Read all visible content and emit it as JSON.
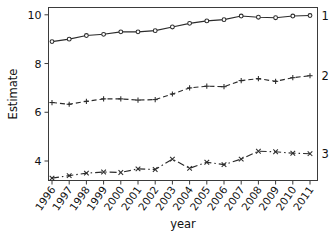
{
  "chart_data": {
    "type": "line",
    "title": "",
    "xlabel": "year",
    "ylabel": "Estimate",
    "grid": false,
    "legend_position": "right-inline-end-of-line",
    "categories": [
      "1996",
      "1997",
      "1998",
      "1999",
      "2000",
      "2001",
      "2002",
      "2003",
      "2004",
      "2005",
      "2006",
      "2007",
      "2008",
      "2009",
      "2010",
      "2011"
    ],
    "x": [
      1996,
      1997,
      1998,
      1999,
      2000,
      2001,
      2002,
      2003,
      2004,
      2005,
      2006,
      2007,
      2008,
      2009,
      2010,
      2011
    ],
    "xlim": [
      1996,
      2011
    ],
    "ylim": [
      3.2,
      10.3
    ],
    "yticks": [
      4,
      6,
      8,
      10
    ],
    "ytick_labels": [
      "4",
      "6",
      "8",
      "10"
    ],
    "series": [
      {
        "name": "1",
        "label": "1",
        "marker": "circle",
        "linestyle": "solid",
        "color": "#2b2b2b",
        "values": [
          8.9,
          9.0,
          9.15,
          9.2,
          9.3,
          9.3,
          9.35,
          9.5,
          9.65,
          9.75,
          9.8,
          9.95,
          9.9,
          9.88,
          9.95,
          9.97
        ]
      },
      {
        "name": "2",
        "label": "2",
        "marker": "plus",
        "linestyle": "dashed",
        "color": "#2b2b2b",
        "values": [
          6.4,
          6.33,
          6.45,
          6.55,
          6.55,
          6.5,
          6.52,
          6.75,
          7.0,
          7.07,
          7.05,
          7.3,
          7.38,
          7.27,
          7.42,
          7.5
        ]
      },
      {
        "name": "3",
        "label": "3",
        "marker": "x",
        "linestyle": "dashdot",
        "color": "#2b2b2b",
        "values": [
          3.3,
          3.4,
          3.5,
          3.55,
          3.53,
          3.68,
          3.65,
          4.08,
          3.7,
          3.95,
          3.85,
          4.08,
          4.4,
          4.38,
          4.32,
          4.3
        ]
      }
    ]
  },
  "axes": {
    "y_label": "Estimate",
    "x_label": "year"
  }
}
